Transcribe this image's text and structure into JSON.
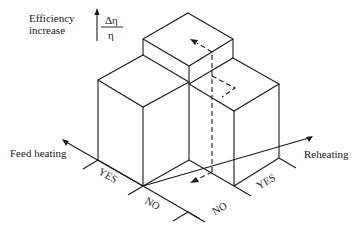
{
  "diagram": {
    "y_axis_label": [
      "Efficiency",
      "increase"
    ],
    "y_axis_quantity": {
      "numerator": "Δη",
      "denominator": "η"
    },
    "left_axis": {
      "label": "Feed heating",
      "ticks": [
        "YES",
        "NO"
      ]
    },
    "right_axis": {
      "label": "Reheating",
      "ticks": [
        "NO",
        "YES"
      ]
    },
    "boxes": [
      {
        "name": "feed-heating-yes-reheating-no",
        "relative_height": "medium"
      },
      {
        "name": "feed-heating-yes-reheating-yes",
        "relative_height": "high"
      },
      {
        "name": "feed-heating-no-reheating-yes",
        "relative_height": "medium"
      },
      {
        "name": "feed-heating-no-reheating-no",
        "relative_height": "baseline"
      }
    ],
    "dashed_path": "path from baseline (NO/NO) up through reheating to combined feed heating + reheating",
    "line_color": "#1a1a1a"
  }
}
